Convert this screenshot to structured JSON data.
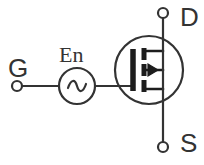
{
  "diagram": {
    "type": "circuit-schematic",
    "background_color": "#ffffff",
    "line_color": "#333333",
    "terminals": [
      {
        "id": "gate",
        "label": "G",
        "x": 17,
        "y": 86,
        "node_radius": 5
      },
      {
        "id": "drain",
        "label": "D",
        "x": 163,
        "y": 13,
        "node_radius": 5
      },
      {
        "id": "source",
        "label": "S",
        "x": 163,
        "y": 147,
        "node_radius": 5
      }
    ],
    "components": [
      {
        "id": "ac-source",
        "kind": "ac-voltage-source",
        "label": "En",
        "symbol": "sine-wave",
        "cx": 77,
        "cy": 86,
        "radius": 18
      },
      {
        "id": "mosfet",
        "kind": "mosfet-n-channel-enhancement",
        "cx": 149,
        "cy": 70,
        "radius": 34,
        "body_arrow_direction": "left",
        "channel_segments": 3
      }
    ],
    "wires": [
      {
        "id": "gate-wire-left",
        "from": "gate-node",
        "to": "ac-source-left"
      },
      {
        "id": "gate-wire-right",
        "from": "ac-source-right",
        "to": "mosfet-gate"
      },
      {
        "id": "drain-wire",
        "from": "drain-node",
        "to": "mosfet-drain"
      },
      {
        "id": "source-wire",
        "from": "mosfet-source",
        "to": "source-node"
      }
    ]
  },
  "labels": {
    "gate": "G",
    "drain": "D",
    "source": "S",
    "ac_source": "En"
  }
}
